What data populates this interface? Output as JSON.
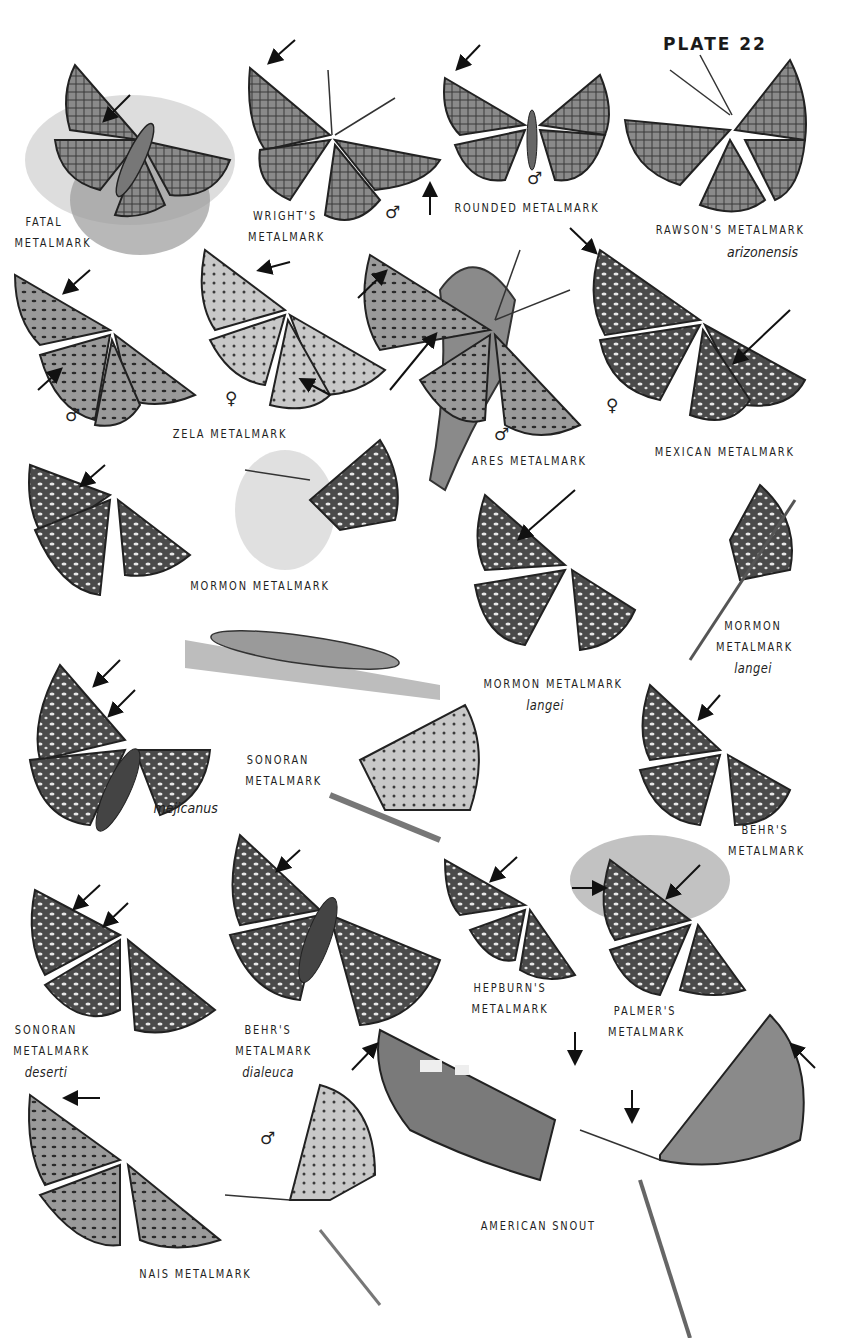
{
  "plate": {
    "title": "PLATE 22",
    "background": "#ffffff",
    "ink_color": "#1a1a1a"
  },
  "species": [
    {
      "id": "fatal",
      "lines": [
        "FATAL",
        "METALMARK"
      ]
    },
    {
      "id": "wrights",
      "lines": [
        "WRIGHT'S",
        "METALMARK"
      ],
      "sex": "♂"
    },
    {
      "id": "rounded",
      "lines": [
        "ROUNDED METALMARK"
      ],
      "sex": "♂"
    },
    {
      "id": "rawsons",
      "lines": [
        "RAWSON'S METALMARK"
      ],
      "subspecies": "arizonensis"
    },
    {
      "id": "zela",
      "lines": [
        "ZELA METALMARK"
      ],
      "sex_male": "♂",
      "sex_female": "♀"
    },
    {
      "id": "ares",
      "lines": [
        "ARES METALMARK"
      ],
      "sex": "♂"
    },
    {
      "id": "mexican",
      "lines": [
        "MEXICAN METALMARK"
      ],
      "sex": "♀"
    },
    {
      "id": "mormon",
      "lines": [
        "MORMON METALMARK"
      ]
    },
    {
      "id": "mormon-langei-a",
      "lines": [
        "MORMON METALMARK"
      ],
      "subspecies": "langei"
    },
    {
      "id": "mormon-langei-b",
      "lines": [
        "MORMON",
        "METALMARK"
      ],
      "subspecies": "langei"
    },
    {
      "id": "mormon-mejicanus",
      "subspecies": "mejicanus"
    },
    {
      "id": "sonoran",
      "lines": [
        "SONORAN",
        "METALMARK"
      ]
    },
    {
      "id": "behrs",
      "lines": [
        "BEHR'S",
        "METALMARK"
      ]
    },
    {
      "id": "sonoran-deserti",
      "lines": [
        "SONORAN",
        "METALMARK"
      ],
      "subspecies": "deserti"
    },
    {
      "id": "behrs-dialeuca",
      "lines": [
        "BEHR'S",
        "METALMARK"
      ],
      "subspecies": "dialeuca"
    },
    {
      "id": "hepburns",
      "lines": [
        "HEPBURN'S",
        "METALMARK"
      ]
    },
    {
      "id": "palmers",
      "lines": [
        "PALMER'S",
        "METALMARK"
      ]
    },
    {
      "id": "nais",
      "lines": [
        "NAIS METALMARK"
      ],
      "sex": "♂"
    },
    {
      "id": "american-snout",
      "lines": [
        "AMERICAN SNOUT"
      ]
    }
  ]
}
